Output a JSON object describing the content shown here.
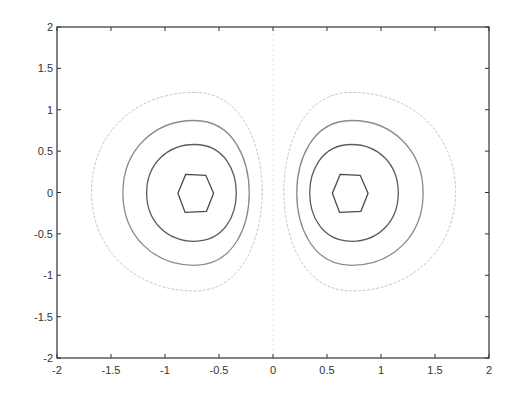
{
  "chart_data": {
    "type": "contour",
    "title": "",
    "xlabel": "",
    "ylabel": "",
    "xlim": [
      -2,
      2
    ],
    "ylim": [
      -2,
      2
    ],
    "grid": false,
    "legend": null,
    "x_ticks": [
      "-2",
      "-1.5",
      "-1",
      "-0.5",
      "0",
      "0.5",
      "1",
      "1.5",
      "2"
    ],
    "y_ticks": [
      "2",
      "1.5",
      "1",
      "0.5",
      "0",
      "-0.5",
      "-1",
      "-1.5",
      "-2"
    ],
    "x_tick_values": [
      -2,
      -1.5,
      -1,
      -0.5,
      0,
      0.5,
      1,
      1.5,
      2
    ],
    "y_tick_values": [
      2,
      1.5,
      1,
      0.5,
      0,
      -0.5,
      -1,
      -1.5,
      -2
    ],
    "function_hint": "z = x * exp(-x^2 - y^2)",
    "colormap": "grayscale (darker = larger |z|)",
    "zero_contour": {
      "x": 0,
      "style": "dotted",
      "color": "#e2e2e2"
    },
    "lobes": [
      {
        "name": "left",
        "center": [
          -0.71,
          0.0
        ],
        "contours": [
          {
            "level": -0.4,
            "color": "#4a4a4a",
            "xrange": [
              -0.88,
              -0.55
            ],
            "yrange": [
              -0.24,
              0.22
            ]
          },
          {
            "level": -0.3,
            "color": "#5c5c5c",
            "xrange": [
              -1.17,
              -0.34
            ],
            "yrange": [
              -0.59,
              0.58
            ]
          },
          {
            "level": -0.2,
            "color": "#8a8a8a",
            "xrange": [
              -1.39,
              -0.22
            ],
            "yrange": [
              -0.88,
              0.87
            ]
          },
          {
            "level": -0.1,
            "color": "#c8c8c8",
            "xrange": [
              -1.68,
              -0.1
            ],
            "yrange": [
              -1.19,
              1.21
            ]
          }
        ]
      },
      {
        "name": "right",
        "center": [
          0.71,
          0.0
        ],
        "contours": [
          {
            "level": 0.4,
            "color": "#4a4a4a",
            "xrange": [
              0.55,
              0.88
            ],
            "yrange": [
              -0.24,
              0.22
            ]
          },
          {
            "level": 0.3,
            "color": "#5c5c5c",
            "xrange": [
              0.34,
              1.16
            ],
            "yrange": [
              -0.59,
              0.58
            ]
          },
          {
            "level": 0.2,
            "color": "#8a8a8a",
            "xrange": [
              0.22,
              1.39
            ],
            "yrange": [
              -0.88,
              0.87
            ]
          },
          {
            "level": 0.1,
            "color": "#c8c8c8",
            "xrange": [
              0.1,
              1.69
            ],
            "yrange": [
              -1.19,
              1.21
            ]
          }
        ]
      }
    ]
  },
  "axes": {
    "frame_color": "#333333",
    "background": "#ffffff"
  }
}
